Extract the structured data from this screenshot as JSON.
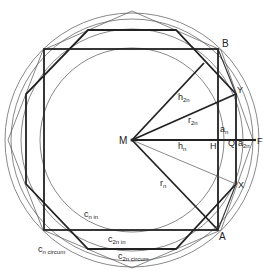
{
  "diagram": {
    "type": "geometry-construction",
    "center": {
      "label": "M"
    },
    "points": {
      "B": "B",
      "A": "A",
      "Y": "Y",
      "X": "X",
      "H": "H",
      "Q": "Q",
      "F": "F"
    },
    "segment_labels": {
      "h2n": {
        "base": "h",
        "sub": "2n"
      },
      "r2n": {
        "base": "r",
        "sub": "2n"
      },
      "an": {
        "base": "a",
        "sub": "n"
      },
      "hn": {
        "base": "h",
        "sub": "n"
      },
      "a2n": {
        "base": "a",
        "sub": "2n"
      },
      "rn": {
        "base": "r",
        "sub": "n"
      }
    },
    "circle_labels": {
      "cn_in": {
        "base": "c",
        "sub": "n in"
      },
      "c2n_in": {
        "base": "c",
        "sub": "2n in"
      },
      "cn_circum": {
        "base": "c",
        "sub": "n circum"
      },
      "c2n_circum": {
        "base": "c",
        "sub": "2n circum"
      }
    }
  }
}
